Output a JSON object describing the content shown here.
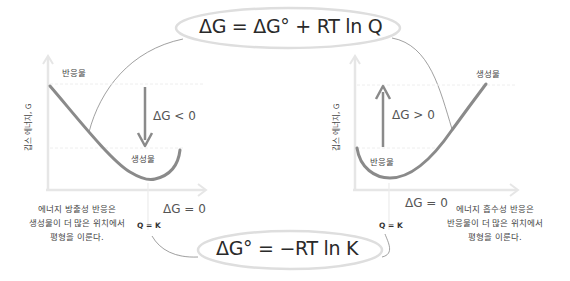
{
  "equations": {
    "top": "ΔG = ΔG° + RT ln Q",
    "bottom": "ΔG° = −RT ln K"
  },
  "left_panel": {
    "title": "exergonic",
    "y_axis_label": "깁스 에너지, G",
    "start_label": "반응물",
    "end_label": "생성물",
    "arrow_label": "ΔG < 0",
    "equilibrium_label": "ΔG = 0",
    "equilibrium_condition": "Q = K",
    "caption_lines": [
      "에너지 방출성 반응은",
      "생성물이 더 많은 위치에서",
      "평형을 이룬다."
    ]
  },
  "right_panel": {
    "title": "endergonic",
    "y_axis_label": "깁스 에너지, G",
    "start_label": "반응물",
    "end_label": "생성물",
    "arrow_label": "ΔG > 0",
    "equilibrium_label": "ΔG = 0",
    "equilibrium_condition": "Q = K",
    "caption_lines": [
      "에너지 흡수성 반응은",
      "반응물이 더 많은 위치에서",
      "평형을 이룬다."
    ]
  },
  "colors": {
    "curve": "#8a8a8a",
    "axis": "#e4e4e4",
    "connector": "#777777",
    "ellipse": "#dcdcdc",
    "text": "#333333"
  }
}
